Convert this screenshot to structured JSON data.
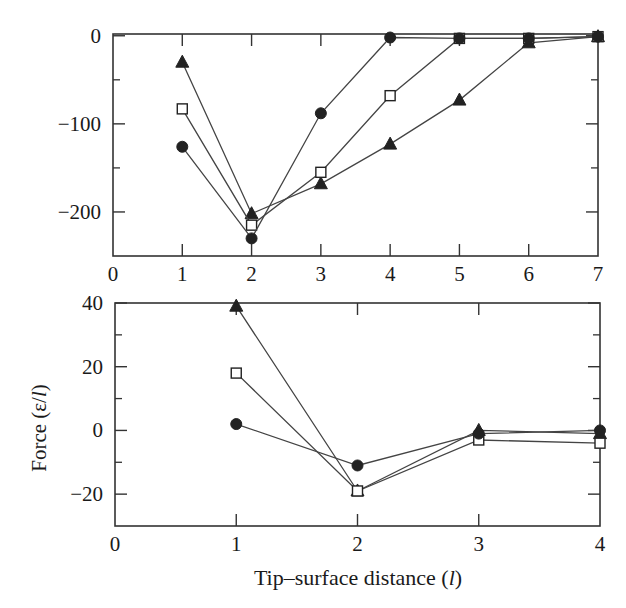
{
  "figure": {
    "ylabel_shared": "Force (ε/l)",
    "xlabel_shared": "Tip–surface distance (l)"
  },
  "chart_data": [
    {
      "type": "line",
      "panel": "top",
      "title": "",
      "xlabel": "",
      "ylabel": "",
      "xlim": [
        0,
        7
      ],
      "ylim": [
        -250,
        2
      ],
      "xticks": [
        0,
        1,
        2,
        3,
        4,
        5,
        6,
        7
      ],
      "yticks": [
        0,
        -100,
        -200
      ],
      "grid": false,
      "legend": null,
      "series": [
        {
          "name": "filled-triangle",
          "marker": "triangle",
          "filled": true,
          "x": [
            1,
            2,
            3,
            4,
            5,
            6,
            7
          ],
          "y": [
            -30,
            -202,
            -168,
            -123,
            -73,
            -8,
            -1
          ]
        },
        {
          "name": "open-square",
          "marker": "square",
          "filled": false,
          "x": [
            1,
            2,
            3,
            4,
            5,
            6,
            7
          ],
          "y": [
            -83,
            -215,
            -155,
            -68,
            -3,
            -3,
            -1
          ]
        },
        {
          "name": "filled-circle",
          "marker": "circle",
          "filled": true,
          "x": [
            1,
            2,
            3,
            4,
            5,
            6,
            7
          ],
          "y": [
            -126,
            -230,
            -88,
            -2,
            -3,
            -3,
            -1
          ]
        }
      ]
    },
    {
      "type": "line",
      "panel": "bottom",
      "title": "",
      "xlabel": "Tip–surface distance (l)",
      "ylabel": "Force (ε/l)",
      "xlim": [
        0,
        4
      ],
      "ylim": [
        -30,
        40
      ],
      "xticks": [
        0,
        1,
        2,
        3,
        4
      ],
      "yticks": [
        40,
        20,
        0,
        -20
      ],
      "grid": false,
      "legend": null,
      "series": [
        {
          "name": "filled-triangle",
          "marker": "triangle",
          "filled": true,
          "x": [
            1,
            2,
            3,
            4
          ],
          "y": [
            39,
            -19,
            0,
            -1
          ]
        },
        {
          "name": "open-square",
          "marker": "square",
          "filled": false,
          "x": [
            1,
            2,
            3,
            4
          ],
          "y": [
            18,
            -19,
            -3,
            -4
          ]
        },
        {
          "name": "filled-circle",
          "marker": "circle",
          "filled": true,
          "x": [
            1,
            2,
            3,
            4
          ],
          "y": [
            2,
            -11,
            -1,
            0
          ]
        }
      ]
    }
  ]
}
